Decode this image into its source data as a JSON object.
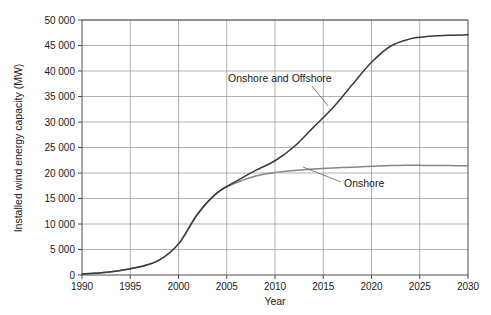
{
  "chart_data": {
    "type": "line",
    "title": "",
    "xlabel": "Year",
    "ylabel": "Installed wind energy capacity (MW)",
    "xlim": [
      1990,
      2030
    ],
    "ylim": [
      0,
      50000
    ],
    "grid": true,
    "legend_position": "inline-annotations",
    "x_ticks": [
      1990,
      1995,
      2000,
      2005,
      2010,
      2015,
      2020,
      2025,
      2030
    ],
    "x_tick_labels": [
      "1990",
      "1995",
      "2000",
      "2005",
      "2010",
      "2015",
      "2020",
      "2025",
      "2030"
    ],
    "y_ticks": [
      0,
      5000,
      10000,
      15000,
      20000,
      25000,
      30000,
      35000,
      40000,
      45000,
      50000
    ],
    "y_tick_labels": [
      "0",
      "5 000",
      "10 000",
      "15 000",
      "20 000",
      "25 000",
      "30 000",
      "35 000",
      "40 000",
      "45 000",
      "50 000"
    ],
    "x": [
      1990,
      1992,
      1994,
      1996,
      1998,
      2000,
      2002,
      2004,
      2006,
      2008,
      2010,
      2012,
      2014,
      2016,
      2018,
      2020,
      2022,
      2024,
      2025,
      2026,
      2028,
      2030
    ],
    "series": [
      {
        "name": "Onshore and Offshore",
        "color": "#3a3a3a",
        "values": [
          200,
          450,
          900,
          1600,
          2900,
          6100,
          12000,
          16100,
          18400,
          20500,
          22400,
          25200,
          29000,
          32800,
          37300,
          41700,
          44900,
          46300,
          46600,
          46800,
          47000,
          47100
        ]
      },
      {
        "name": "Onshore",
        "color": "#868686",
        "values": [
          200,
          450,
          900,
          1600,
          2900,
          6100,
          12000,
          16100,
          18100,
          19400,
          20100,
          20500,
          20800,
          21000,
          21150,
          21300,
          21450,
          21500,
          21500,
          21480,
          21450,
          21400
        ]
      }
    ],
    "annotations": [
      {
        "text": "Onshore and Offshore",
        "label_x": 228,
        "label_y": 82,
        "leader": [
          [
            312,
            86
          ],
          [
            328,
            106
          ]
        ]
      },
      {
        "text": "Onshore",
        "label_x": 344,
        "label_y": 187,
        "leader": [
          [
            341,
            182
          ],
          [
            303,
            167
          ]
        ]
      }
    ]
  },
  "plot_geometry": {
    "left": 82,
    "right": 468,
    "top": 20,
    "bottom": 275
  }
}
